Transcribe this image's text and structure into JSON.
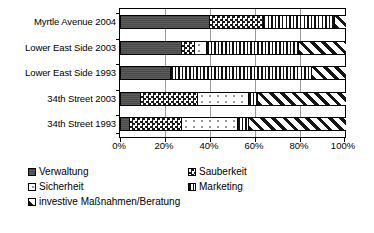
{
  "chart_data": {
    "type": "bar",
    "orientation": "horizontal",
    "stacked": true,
    "units": "percent",
    "title": "",
    "subtitle": "",
    "xlabel": "",
    "ylabel": "",
    "xlim": [
      0,
      100
    ],
    "grid": true,
    "legend_position": "bottom-left",
    "xticks": [
      "0%",
      "20%",
      "40%",
      "60%",
      "80%",
      "100%"
    ],
    "xtick_values": [
      0,
      20,
      40,
      60,
      80,
      100
    ],
    "categories": [
      "Myrtle Avenue 2004",
      "Lower East Side 2003",
      "Lower East Side 1993",
      "34th Street 2003",
      "34th Street 1993"
    ],
    "series": [
      {
        "name": "Verwaltung",
        "pattern": "solid-dark",
        "values": [
          39.5,
          27.0,
          22.0,
          9.0,
          4.0
        ]
      },
      {
        "name": "Sauberkeit",
        "pattern": "checkerboard",
        "values": [
          24.0,
          6.0,
          0.0,
          25.0,
          23.0
        ]
      },
      {
        "name": "Sicherheit",
        "pattern": "white-dotted",
        "values": [
          0.0,
          5.0,
          0.0,
          23.0,
          25.0
        ]
      },
      {
        "name": "Marketing",
        "pattern": "vertical-stripes",
        "values": [
          31.5,
          41.0,
          63.0,
          4.0,
          5.0
        ]
      },
      {
        "name": "investive Maßnahmen/Beratung",
        "pattern": "diagonal-stripes",
        "values": [
          5.0,
          21.0,
          15.0,
          39.0,
          43.0
        ]
      }
    ]
  },
  "legend": {
    "items": [
      {
        "label": "Verwaltung"
      },
      {
        "label": "Sauberkeit"
      },
      {
        "label": "Sicherheit"
      },
      {
        "label": "Marketing"
      },
      {
        "label": "investive Maßnahmen/Beratung"
      }
    ]
  },
  "colors": {
    "verwaltung": "#4a4a4a",
    "axis": "#000000",
    "gridline": "#9a9a9a",
    "background": "#ffffff"
  }
}
